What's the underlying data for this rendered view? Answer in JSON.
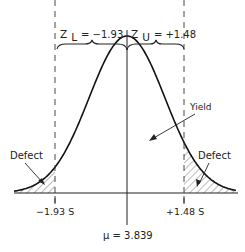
{
  "diagram": {
    "z_lower": {
      "symbol": "Z",
      "subscript": "L",
      "value_text": "= −1.93"
    },
    "z_upper": {
      "symbol": "Z",
      "subscript": "U",
      "value_text": "= +1.48"
    },
    "lower_limit_label": "−1.93 S",
    "upper_limit_label": "+1.48 S",
    "mean_label": "μ = 3.839",
    "defect_left_label": "Defect",
    "defect_right_label": "Defect",
    "yield_label": "Yield",
    "z_lower_value": -1.93,
    "z_upper_value": 1.48,
    "mean_value": 3.839,
    "line_color": "#222222"
  }
}
